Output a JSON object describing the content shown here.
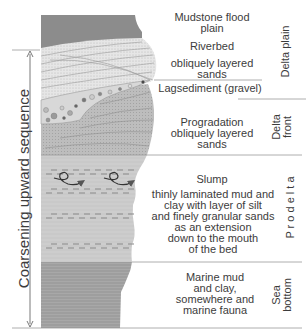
{
  "sequence_label": "Coarsening upward sequence",
  "layers": [
    {
      "name": "Mudstone flood plain",
      "lines": [
        "Mudstone flood",
        "plain"
      ]
    },
    {
      "name": "Riverbed",
      "lines": [
        "Riverbed"
      ]
    },
    {
      "name": "obliquely layered sands",
      "lines": [
        "obliquely layered",
        "sands"
      ]
    },
    {
      "name": "Lagsediment (gravel)",
      "lines": [
        "Lagsediment (gravel)"
      ]
    },
    {
      "name": "Progradation obliquely layered sands",
      "lines": [
        "Progradation",
        "obliquely layered",
        "sands"
      ]
    },
    {
      "name": "Slump",
      "lines": [
        "Slump"
      ]
    },
    {
      "name": "Prodelta description",
      "lines": [
        "thinly laminated mud and",
        "clay with layer of silt",
        "and finely granular sands",
        "as an extension",
        "down to the mouth",
        "of the bed"
      ]
    },
    {
      "name": "Sea bottom description",
      "lines": [
        "Marine mud",
        "and clay,",
        "somewhere and",
        "marine fauna"
      ]
    }
  ],
  "zones": [
    {
      "name": "delta-plain",
      "lines": [
        "Delta plain"
      ]
    },
    {
      "name": "delta-front",
      "lines": [
        "Delta",
        "front"
      ]
    },
    {
      "name": "prodelta",
      "lines": [
        "P r o d e l t a"
      ]
    },
    {
      "name": "sea-bottom",
      "lines": [
        "Sea",
        "bottom"
      ]
    }
  ],
  "colors": {
    "mudstone": "#8c8c8c",
    "sand_light": "#e4e4e4",
    "progradation": "#b4b4b4",
    "prodelta": "#c8c8c8",
    "sea_bottom": "#a0a0a0",
    "line": "#9a9a9a",
    "text": "#3c3c3c"
  }
}
